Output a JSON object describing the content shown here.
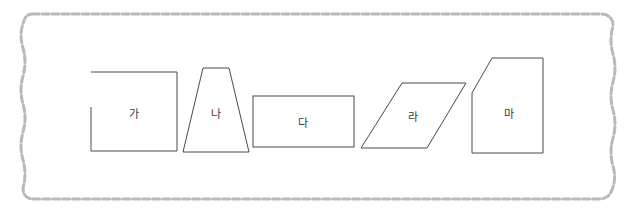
{
  "frame": {
    "style": "wavy-dashed-border",
    "color": "#b9b9b9"
  },
  "shapes": [
    {
      "id": "ga",
      "label": "가",
      "type": "open-rectangle",
      "cx": 134,
      "cy": 113
    },
    {
      "id": "na",
      "label": "나",
      "type": "trapezoid",
      "cx": 216,
      "cy": 113
    },
    {
      "id": "da",
      "label": "다",
      "type": "rectangle",
      "cx": 303,
      "cy": 122
    },
    {
      "id": "ra",
      "label": "라",
      "type": "parallelogram",
      "cx": 413,
      "cy": 116
    },
    {
      "id": "ma",
      "label": "마",
      "type": "pentagon",
      "cx": 509,
      "cy": 113
    }
  ]
}
